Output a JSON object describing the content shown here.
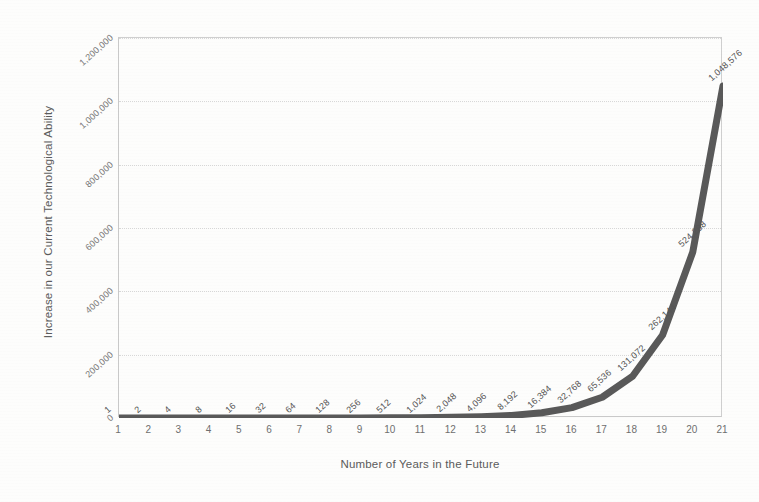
{
  "chart_data": {
    "type": "line",
    "title": "",
    "xlabel": "Number of Years in the Future",
    "ylabel": "Increase in our Current Technological Ability",
    "x": [
      1,
      2,
      3,
      4,
      5,
      6,
      7,
      8,
      9,
      10,
      11,
      12,
      13,
      14,
      15,
      16,
      17,
      18,
      19,
      20,
      21
    ],
    "values": [
      1,
      2,
      4,
      8,
      16,
      32,
      64,
      128,
      256,
      512,
      1024,
      2048,
      4096,
      8192,
      16384,
      32768,
      65536,
      131072,
      262144,
      524288,
      1048576
    ],
    "point_labels": [
      "1",
      "2",
      "4",
      "8",
      "16",
      "32",
      "64",
      "128",
      "256",
      "512",
      "1,024",
      "2,048",
      "4,096",
      "8,192",
      "16,384",
      "32,768",
      "65,536",
      "131,072",
      "262,144",
      "524,288",
      "1,048,576"
    ],
    "xtick_labels": [
      "1",
      "2",
      "3",
      "4",
      "5",
      "6",
      "7",
      "8",
      "9",
      "10",
      "11",
      "12",
      "13",
      "14",
      "15",
      "16",
      "17",
      "18",
      "19",
      "20",
      "21"
    ],
    "ytick_labels": [
      "0",
      "200,000",
      "400,000",
      "600,000",
      "800,000",
      "1,000,000",
      "1,200,000"
    ],
    "ytick_values": [
      0,
      200000,
      400000,
      600000,
      800000,
      1000000,
      1200000
    ],
    "ylim": [
      0,
      1200000
    ],
    "xlim": [
      1,
      21
    ],
    "grid": true,
    "legend": "none",
    "series_color": "#595959",
    "grid_color": "#d8d8d8",
    "axis_color": "#c9c9c9",
    "label_color": "#6f6f6f"
  }
}
